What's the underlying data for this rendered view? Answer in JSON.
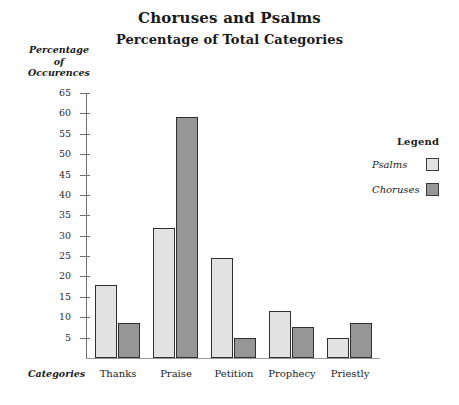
{
  "chart_data": {
    "type": "bar",
    "title": "Choruses and Psalms",
    "subtitle": "Percentage of Total Categories",
    "xlabel": "Categories",
    "ylabel": "Percentage of Occurences",
    "ylabel_lines": [
      "Percentage",
      "of",
      "Occurences"
    ],
    "categories": [
      "Thanks",
      "Praise",
      "Petition",
      "Prophecy",
      "Priestly"
    ],
    "series": [
      {
        "name": "Psalms",
        "color": "#e2e2e2",
        "values": [
          18,
          32,
          24.5,
          11.5,
          5
        ]
      },
      {
        "name": "Choruses",
        "color": "#969696",
        "values": [
          8.5,
          59,
          5,
          7.5,
          8.5
        ]
      }
    ],
    "ylim": [
      0,
      65
    ],
    "ytick_step": 5,
    "yticks": [
      65,
      60,
      55,
      50,
      45,
      40,
      35,
      30,
      25,
      20,
      15,
      10,
      5
    ],
    "grid": false,
    "legend": {
      "title": "Legend",
      "position": "right",
      "entries": [
        "Psalms",
        "Choruses"
      ]
    }
  }
}
